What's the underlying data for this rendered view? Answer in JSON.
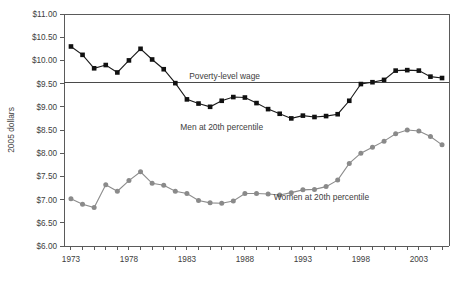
{
  "chart_data": {
    "type": "line",
    "title": "",
    "subtitle": "",
    "xlabel": "",
    "ylabel": "2005 dollars",
    "xlim": [
      1972.4,
      2005.6
    ],
    "ylim": [
      6.0,
      11.0
    ],
    "grid": false,
    "legend_position": "inline-annotations",
    "y_tick_labels": [
      "$6.00",
      "$6.50",
      "$7.00",
      "$7.50",
      "$8.00",
      "$8.50",
      "$9.00",
      "$9.50",
      "$10.00",
      "$10.50",
      "$11.00"
    ],
    "y_tick_values": [
      6.0,
      6.5,
      7.0,
      7.5,
      8.0,
      8.5,
      9.0,
      9.5,
      10.0,
      10.5,
      11.0
    ],
    "x_tick_labels": [
      "1973",
      "1978",
      "1983",
      "1988",
      "1993",
      "1998",
      "2003"
    ],
    "x_tick_values": [
      1973,
      1978,
      1983,
      1988,
      1993,
      1998,
      2003
    ],
    "x_minor_ticks": [
      1973,
      1974,
      1975,
      1976,
      1977,
      1978,
      1979,
      1980,
      1981,
      1982,
      1983,
      1984,
      1985,
      1986,
      1987,
      1988,
      1989,
      1990,
      1991,
      1992,
      1993,
      1994,
      1995,
      1996,
      1997,
      1998,
      1999,
      2000,
      2001,
      2002,
      2003,
      2004,
      2005
    ],
    "x": [
      1973,
      1974,
      1975,
      1976,
      1977,
      1978,
      1979,
      1980,
      1981,
      1982,
      1983,
      1984,
      1985,
      1986,
      1987,
      1988,
      1989,
      1990,
      1991,
      1992,
      1993,
      1994,
      1995,
      1996,
      1997,
      1998,
      1999,
      2000,
      2001,
      2002,
      2003,
      2004,
      2005
    ],
    "series": [
      {
        "name": "Men at 20th percentile",
        "marker": "square",
        "color": "#111111",
        "values": [
          10.3,
          10.12,
          9.83,
          9.9,
          9.74,
          10.0,
          10.25,
          10.02,
          9.81,
          9.51,
          9.16,
          9.07,
          9.0,
          9.13,
          9.21,
          9.2,
          9.08,
          8.95,
          8.85,
          8.75,
          8.81,
          8.78,
          8.8,
          8.84,
          9.13,
          9.49,
          9.53,
          9.58,
          9.78,
          9.79,
          9.78,
          9.65,
          9.62
        ]
      },
      {
        "name": "Women at 20th percentile",
        "marker": "circle",
        "color": "#8a8a8a",
        "values": [
          7.02,
          6.9,
          6.83,
          7.32,
          7.18,
          7.41,
          7.6,
          7.35,
          7.31,
          7.18,
          7.13,
          6.98,
          6.93,
          6.92,
          6.97,
          7.13,
          7.13,
          7.12,
          7.1,
          7.15,
          7.21,
          7.22,
          7.28,
          7.42,
          7.78,
          8.0,
          8.13,
          8.26,
          8.42,
          8.5,
          8.48,
          8.36,
          8.18
        ]
      }
    ],
    "reference_lines": [
      {
        "label": "Poverty-level wage",
        "value": 9.52,
        "label_x": 1983.2
      }
    ],
    "annotations": [
      {
        "text": "Men at 20th percentile",
        "x": 1986.0,
        "y": 8.5
      },
      {
        "text": "Women at 20th percentile",
        "x": 1994.6,
        "y": 7.0
      }
    ]
  }
}
